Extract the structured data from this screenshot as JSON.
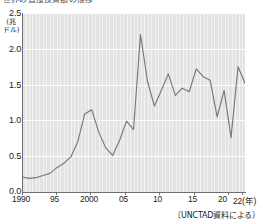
{
  "figure": {
    "title_clipped": "世界の直接投資額の推移",
    "source_note": "〔UNCTAD資料による〕"
  },
  "axes": {
    "y_unit_line1": "(兆",
    "y_unit_line2": "ドル)",
    "y_ticks": [
      "0.0",
      "0.5",
      "1.0",
      "1.5",
      "2.0",
      "2.5"
    ],
    "y_tick_values": [
      0.0,
      0.5,
      1.0,
      1.5,
      2.0,
      2.5
    ],
    "x_ticks": [
      "1990",
      "95",
      "2000",
      "05",
      "10",
      "15",
      "20",
      "22(年)"
    ],
    "x_tick_values": [
      1990,
      1995,
      2000,
      2005,
      2010,
      2015,
      2020,
      2022
    ]
  },
  "style": {
    "plot_background": "#e3e3e3",
    "gridline_color": "#fdfdfd",
    "line_color": "#777777",
    "axis_color": "#6e6e6e",
    "text_color": "#1e1e1e"
  },
  "chart_data": {
    "type": "line",
    "title": "世界の直接投資額の推移",
    "xlabel": "(年)",
    "ylabel": "(兆ドル)",
    "xlim": [
      1990,
      2022
    ],
    "ylim": [
      0.0,
      2.5
    ],
    "grid": true,
    "legend": "none",
    "annotation": "〔UNCTAD資料による〕",
    "x": [
      1990,
      1991,
      1992,
      1993,
      1994,
      1995,
      1996,
      1997,
      1998,
      1999,
      2000,
      2001,
      2002,
      2003,
      2004,
      2005,
      2006,
      2007,
      2008,
      2009,
      2010,
      2011,
      2012,
      2013,
      2014,
      2015,
      2016,
      2017,
      2018,
      2019,
      2020,
      2021,
      2022
    ],
    "series": [
      {
        "name": "世界の直接投資額",
        "values": [
          0.21,
          0.19,
          0.2,
          0.23,
          0.26,
          0.34,
          0.4,
          0.49,
          0.7,
          1.09,
          1.15,
          0.84,
          0.62,
          0.51,
          0.72,
          0.99,
          0.87,
          2.2,
          1.55,
          1.2,
          1.42,
          1.65,
          1.35,
          1.45,
          1.4,
          1.72,
          1.61,
          1.56,
          1.05,
          1.42,
          0.76,
          1.75,
          1.52
        ]
      }
    ]
  }
}
